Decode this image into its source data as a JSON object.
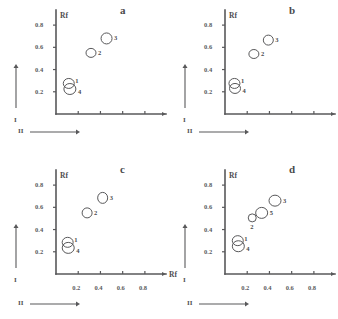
{
  "figure": {
    "ink_color": "#58585a",
    "background_color": "#ffffff"
  },
  "axes_common": {
    "y_title": "Rf",
    "x_title": "Rf",
    "y_ticks": [
      "0.8",
      "0.6",
      "0.4",
      "0.2"
    ],
    "y_tick_values": [
      0.8,
      0.6,
      0.4,
      0.2
    ],
    "x_ticks": [
      "0.2",
      "0.4",
      "0.6",
      "0.8"
    ],
    "x_tick_values": [
      0.2,
      0.4,
      0.6,
      0.8
    ],
    "direction_first": "I",
    "direction_second": "II",
    "xlim": [
      0.0,
      0.9
    ],
    "ylim": [
      0.0,
      0.9
    ]
  },
  "chart_data": [
    {
      "type": "scatter",
      "panel": "a",
      "title": "a",
      "xlabel": "Rf",
      "ylabel": "Rf",
      "xlim": [
        0.0,
        0.9
      ],
      "ylim": [
        0.0,
        0.9
      ],
      "x_tick_labels_visible": false,
      "x_axis_title_visible": false,
      "grid": false,
      "legend": "none",
      "marker": "open-ellipse",
      "points": [
        {
          "label": "1",
          "x": 0.115,
          "y": 0.275,
          "rx": 5.5,
          "ry": 5.0,
          "label_pos": "upper-right"
        },
        {
          "label": "4",
          "x": 0.125,
          "y": 0.225,
          "rx": 6.0,
          "ry": 5.5,
          "label_pos": "lower-right"
        },
        {
          "label": "2",
          "x": 0.315,
          "y": 0.55,
          "rx": 5.0,
          "ry": 4.5,
          "label_pos": "right"
        },
        {
          "label": "3",
          "x": 0.455,
          "y": 0.68,
          "rx": 5.5,
          "ry": 5.5,
          "label_pos": "right"
        }
      ]
    },
    {
      "type": "scatter",
      "panel": "b",
      "title": "b",
      "xlabel": "Rf",
      "ylabel": "Rf",
      "xlim": [
        0.0,
        0.9
      ],
      "ylim": [
        0.0,
        0.9
      ],
      "x_tick_labels_visible": false,
      "x_axis_title_visible": false,
      "grid": false,
      "legend": "none",
      "marker": "open-ellipse",
      "points": [
        {
          "label": "1",
          "x": 0.085,
          "y": 0.275,
          "rx": 5.5,
          "ry": 5.0,
          "label_pos": "upper-right"
        },
        {
          "label": "4",
          "x": 0.09,
          "y": 0.23,
          "rx": 5.5,
          "ry": 5.0,
          "label_pos": "lower-right"
        },
        {
          "label": "2",
          "x": 0.26,
          "y": 0.54,
          "rx": 5.0,
          "ry": 4.5,
          "label_pos": "right"
        },
        {
          "label": "3",
          "x": 0.39,
          "y": 0.665,
          "rx": 5.0,
          "ry": 5.0,
          "label_pos": "right"
        }
      ]
    },
    {
      "type": "scatter",
      "panel": "c",
      "title": "c",
      "xlabel": "Rf",
      "ylabel": "Rf",
      "xlim": [
        0.0,
        0.9
      ],
      "ylim": [
        0.0,
        0.9
      ],
      "x_tick_labels_visible": true,
      "x_axis_title_visible": true,
      "grid": false,
      "legend": "none",
      "marker": "open-ellipse",
      "points": [
        {
          "label": "1",
          "x": 0.105,
          "y": 0.285,
          "rx": 5.5,
          "ry": 5.0,
          "label_pos": "upper-right"
        },
        {
          "label": "4",
          "x": 0.11,
          "y": 0.235,
          "rx": 6.0,
          "ry": 5.5,
          "label_pos": "lower-right"
        },
        {
          "label": "2",
          "x": 0.28,
          "y": 0.55,
          "rx": 5.0,
          "ry": 5.0,
          "label_pos": "right"
        },
        {
          "label": "3",
          "x": 0.42,
          "y": 0.685,
          "rx": 5.0,
          "ry": 5.5,
          "label_pos": "right"
        }
      ]
    },
    {
      "type": "scatter",
      "panel": "d",
      "title": "d",
      "xlabel": "Rf",
      "ylabel": "Rf",
      "xlim": [
        0.0,
        0.9
      ],
      "ylim": [
        0.0,
        0.9
      ],
      "x_tick_labels_visible": true,
      "x_axis_title_visible": true,
      "grid": false,
      "legend": "none",
      "marker": "open-ellipse",
      "points": [
        {
          "label": "1",
          "x": 0.115,
          "y": 0.3,
          "rx": 5.5,
          "ry": 5.0,
          "label_pos": "upper-right"
        },
        {
          "label": "4",
          "x": 0.12,
          "y": 0.25,
          "rx": 6.0,
          "ry": 5.5,
          "label_pos": "lower-right"
        },
        {
          "label": "2",
          "x": 0.245,
          "y": 0.505,
          "rx": 4.0,
          "ry": 4.0,
          "label_pos": "below"
        },
        {
          "label": "5",
          "x": 0.33,
          "y": 0.55,
          "rx": 6.0,
          "ry": 5.5,
          "label_pos": "right"
        },
        {
          "label": "3",
          "x": 0.45,
          "y": 0.66,
          "rx": 6.0,
          "ry": 5.5,
          "label_pos": "right"
        }
      ]
    }
  ]
}
